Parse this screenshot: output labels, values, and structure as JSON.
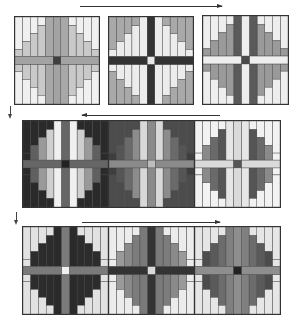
{
  "diagram": {
    "arrows": [
      {
        "id": "row1",
        "direction": "right"
      },
      {
        "id": "row2",
        "direction": "left"
      },
      {
        "id": "row3",
        "direction": "right"
      },
      {
        "id": "down1",
        "direction": "down"
      },
      {
        "id": "down2",
        "direction": "down"
      }
    ],
    "colors": {
      "white": "#f2f2f2",
      "light": "#d2d2d2",
      "mid": "#a9a9a9",
      "midDark": "#8a8a8a",
      "dark": "#5e5e5e",
      "veryDark": "#2e2e2e"
    },
    "rows": [
      {
        "blocks": [
          {
            "outer": "#f0f0f0",
            "inner": "#c9c9c9",
            "innerCenter": "#a8a8a8",
            "bar": "#a3a3a3",
            "center": "#404040"
          },
          {
            "outer": "#a9a9a9",
            "inner": "#ececec",
            "innerCenter": "#ececec",
            "bar": "#333333",
            "center": "#e8e8e8"
          },
          {
            "outer": "#eeeeee",
            "inner": "#9a9a9a",
            "innerCenter": "#5a5a5a",
            "bar": "#eeeeee",
            "center": "#4a4a4a",
            "mirrorShade": true
          }
        ]
      },
      {
        "blocks": [
          {
            "outer": "#2a2a2a",
            "inner": "#f0f0f0",
            "innerCenter": "#f0f0f0",
            "bar": "#666666",
            "center": "#222222",
            "ringShades": [
              "#2a2a2a",
              "#606060",
              "#9a9a9a",
              "#cfcfcf",
              "#f0f0f0"
            ]
          },
          {
            "outer": "#4c4c4c",
            "inner": "#8c8c8c",
            "innerCenter": "#d8d8d8",
            "bar": "#8a8a8a",
            "center": "#bdbdbd",
            "ringShades": [
              "#3e3e3e",
              "#555555",
              "#6a6a6a",
              "#8c8c8c",
              "#d8d8d8"
            ]
          },
          {
            "outer": "#f2f2f2",
            "inner": "#6a6a6a",
            "innerCenter": "#e6e6e6",
            "bar": "#dadada",
            "center": "#555555",
            "ringShades": [
              "#f2f2f2",
              "#8a8a8a",
              "#6a6a6a",
              "#555555",
              "#e6e6e6"
            ]
          }
        ]
      },
      {
        "blocks": [
          {
            "outer": "#e2e2e2",
            "inner": "#2a2a2a",
            "innerCenter": "#2a2a2a",
            "bar": "#7a7a7a",
            "center": "#f0f0f0",
            "ringShades": [
              "#e2e2e2",
              "#2c2c2c",
              "#2c2c2c",
              "#2c2c2c",
              "#2c2c2c"
            ]
          },
          {
            "outer": "#ececec",
            "inner": "#8c8c8c",
            "innerCenter": "#7a7a7a",
            "bar": "#333333",
            "center": "#d9d9d9",
            "ringShades": [
              "#ececec",
              "#9a9a9a",
              "#8a8a8a",
              "#7c7c7c",
              "#6e6e6e"
            ]
          },
          {
            "outer": "#e6e6e6",
            "inner": "#5a5a5a",
            "innerCenter": "#808080",
            "bar": "#8e8e8e",
            "center": "#222222",
            "ringShades": [
              "#e6e6e6",
              "#4c4c4c",
              "#5a5a5a",
              "#6c6c6c",
              "#808080"
            ]
          }
        ]
      }
    ]
  }
}
